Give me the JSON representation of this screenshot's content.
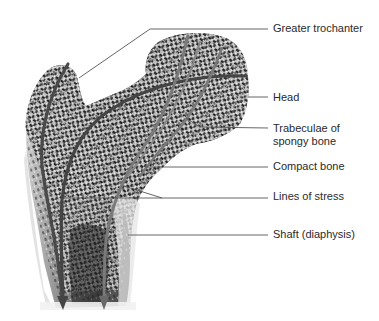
{
  "figure": {
    "labels": [
      {
        "id": "greater-trochanter",
        "lines": [
          "Greater trochanter"
        ],
        "x": 273,
        "y": 22
      },
      {
        "id": "head",
        "lines": [
          "Head"
        ],
        "x": 273,
        "y": 91
      },
      {
        "id": "trabeculae",
        "lines": [
          "Trabeculae of",
          "spongy bone"
        ],
        "x": 273,
        "y": 122
      },
      {
        "id": "compact-bone",
        "lines": [
          "Compact bone"
        ],
        "x": 273,
        "y": 160
      },
      {
        "id": "lines-of-stress",
        "lines": [
          "Lines of stress"
        ],
        "x": 273,
        "y": 190
      },
      {
        "id": "shaft",
        "lines": [
          "Shaft (diaphysis)"
        ],
        "x": 273,
        "y": 228
      }
    ],
    "colors": {
      "leader_line": "#555555",
      "stress_line_dark": "#4a4a4a",
      "stress_line_light": "#7a7a7a",
      "bone_dark": "#2b2b2b",
      "bone_mid": "#8a8a8a",
      "bone_light": "#d8d8d8",
      "label_text": "#2a2a2a"
    }
  }
}
